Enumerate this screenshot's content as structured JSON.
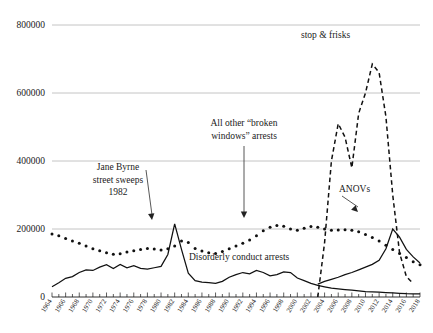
{
  "chart_data": {
    "type": "line",
    "title": "",
    "xlabel": "",
    "ylabel": "",
    "xlim": [
      1964,
      2018
    ],
    "ylim": [
      0,
      800000
    ],
    "grid": true,
    "legend_position": "inline-annotations",
    "y_ticks": [
      "0",
      "200000",
      "400000",
      "600000",
      "800000"
    ],
    "y_tick_values": [
      0,
      200000,
      400000,
      600000,
      800000
    ],
    "x_ticks": [
      "1964",
      "1966",
      "1968",
      "1970",
      "1972",
      "1974",
      "1976",
      "1978",
      "1980",
      "1982",
      "1984",
      "1986",
      "1988",
      "1990",
      "1992",
      "1994",
      "1996",
      "1998",
      "2000",
      "2002",
      "2004",
      "2006",
      "2008",
      "2010",
      "2012",
      "2014",
      "2016",
      "2018"
    ],
    "x_tick_values": [
      1964,
      1966,
      1968,
      1970,
      1972,
      1974,
      1976,
      1978,
      1980,
      1982,
      1984,
      1986,
      1988,
      1990,
      1992,
      1994,
      1996,
      1998,
      2000,
      2002,
      2004,
      2006,
      2008,
      2010,
      2012,
      2014,
      2016,
      2018
    ],
    "series": [
      {
        "name": "All other \"broken windows\" arrests",
        "style": "dotted",
        "x": [
          1964,
          1965,
          1966,
          1967,
          1968,
          1969,
          1970,
          1971,
          1972,
          1973,
          1974,
          1975,
          1976,
          1977,
          1978,
          1979,
          1980,
          1981,
          1982,
          1983,
          1984,
          1985,
          1986,
          1987,
          1988,
          1989,
          1990,
          1991,
          1992,
          1993,
          1994,
          1995,
          1996,
          1997,
          1998,
          1999,
          2000,
          2001,
          2002,
          2003,
          2004,
          2005,
          2006,
          2007,
          2008,
          2009,
          2010,
          2011,
          2012,
          2013,
          2014,
          2015,
          2016,
          2017,
          2018
        ],
        "values": [
          185000,
          180000,
          172000,
          165000,
          158000,
          150000,
          142000,
          136000,
          130000,
          126000,
          127000,
          132000,
          136000,
          140000,
          143000,
          141000,
          138000,
          142000,
          150000,
          165000,
          160000,
          143000,
          135000,
          130000,
          128000,
          134000,
          142000,
          150000,
          158000,
          168000,
          180000,
          195000,
          205000,
          210000,
          208000,
          200000,
          196000,
          202000,
          207000,
          205000,
          200000,
          196000,
          197000,
          198000,
          196000,
          192000,
          184000,
          175000,
          165000,
          152000,
          140000,
          128000,
          116000,
          104000,
          95000
        ]
      },
      {
        "name": "Disorderly conduct arrests",
        "style": "solid",
        "x": [
          1964,
          1965,
          1966,
          1967,
          1968,
          1969,
          1970,
          1971,
          1972,
          1973,
          1974,
          1975,
          1976,
          1977,
          1978,
          1979,
          1980,
          1981,
          1982,
          1983,
          1984,
          1985,
          1986,
          1987,
          1988,
          1989,
          1990,
          1991,
          1992,
          1993,
          1994,
          1995,
          1996,
          1997,
          1998,
          1999,
          2000,
          2001,
          2002,
          2003,
          2004,
          2005,
          2006,
          2007,
          2008,
          2009,
          2010,
          2011,
          2012,
          2013,
          2014,
          2015,
          2016,
          2017,
          2018
        ],
        "values": [
          30000,
          42000,
          55000,
          60000,
          72000,
          80000,
          78000,
          88000,
          95000,
          84000,
          96000,
          86000,
          92000,
          84000,
          82000,
          86000,
          90000,
          125000,
          215000,
          140000,
          70000,
          48000,
          44000,
          42000,
          40000,
          46000,
          58000,
          66000,
          72000,
          68000,
          78000,
          72000,
          62000,
          66000,
          74000,
          72000,
          56000,
          48000,
          40000,
          34000,
          30000,
          26000,
          24000,
          22000,
          20000,
          18000,
          16000,
          15000,
          14000,
          13000,
          12000,
          11000,
          10000,
          9500,
          9000
        ]
      },
      {
        "name": "ANOVs",
        "style": "solid",
        "x": [
          2003,
          2004,
          2005,
          2006,
          2007,
          2008,
          2009,
          2010,
          2011,
          2012,
          2013,
          2014,
          2015,
          2016,
          2017,
          2018
        ],
        "values": [
          38000,
          46000,
          52000,
          58000,
          66000,
          72000,
          80000,
          88000,
          96000,
          108000,
          142000,
          200000,
          176000,
          140000,
          118000,
          100000
        ],
        "note": "second solid line, rises from 2003 to a ~200000 spike in 2014 then declines"
      },
      {
        "name": "stop & frisks",
        "style": "dashed",
        "x": [
          2003,
          2004,
          2005,
          2006,
          2007,
          2008,
          2009,
          2010,
          2011,
          2012,
          2013,
          2014,
          2015,
          2016,
          2017
        ],
        "values": [
          0,
          160000,
          400000,
          510000,
          470000,
          380000,
          540000,
          600000,
          685000,
          660000,
          530000,
          300000,
          130000,
          60000,
          40000
        ]
      }
    ],
    "annotations": [
      {
        "id": "jane-byrne",
        "text_lines": [
          "Jane Byrne",
          "street sweeps",
          "1982"
        ],
        "points_to_year": 1982,
        "points_to_value": 215000
      },
      {
        "id": "broken-windows",
        "text_lines": [
          "All other “broken",
          "windows” arrests"
        ],
        "points_to_year": 1994,
        "points_to_value": 180000
      },
      {
        "id": "stop-frisks",
        "text_lines": [
          "stop & frisks"
        ],
        "points_to_year": 2011,
        "points_to_value": 685000
      },
      {
        "id": "anovs",
        "text_lines": [
          "ANOVs"
        ],
        "points_to_year": 2014,
        "points_to_value": 200000
      },
      {
        "id": "disorderly-conduct",
        "text_lines": [
          "Disorderly conduct arrests"
        ],
        "points_to_year": 1997,
        "points_to_value": 66000
      }
    ]
  },
  "annotation_text": {
    "jane_byrne_l1": "Jane Byrne",
    "jane_byrne_l2": "street sweeps",
    "jane_byrne_l3": "1982",
    "broken_windows_l1": "All other “broken",
    "broken_windows_l2": "windows” arrests",
    "stop_frisks": "stop & frisks",
    "anovs": "ANOVs",
    "disorderly": "Disorderly conduct arrests"
  },
  "axis_labels": {
    "y0": "0",
    "y1": "200000",
    "y2": "400000",
    "y3": "600000",
    "y4": "800000"
  },
  "colors": {
    "ink": "#111111",
    "gridline": "#b5b5b5",
    "background": "#ffffff",
    "arrow": "#444444"
  }
}
